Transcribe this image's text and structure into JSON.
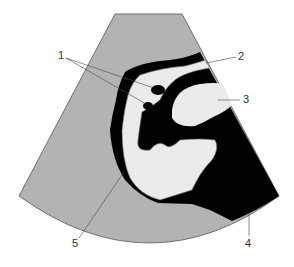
{
  "diagram": {
    "type": "ultrasound-schematic",
    "colors": {
      "background": "#ffffff",
      "sector": "#b3b3b3",
      "dark": "#000000",
      "light": "#ebebeb",
      "outline": "#555555"
    },
    "labels": [
      {
        "id": "1",
        "text": "1"
      },
      {
        "id": "2",
        "text": "2"
      },
      {
        "id": "3",
        "text": "3"
      },
      {
        "id": "4",
        "text": "4"
      },
      {
        "id": "5",
        "text": "5"
      }
    ]
  }
}
